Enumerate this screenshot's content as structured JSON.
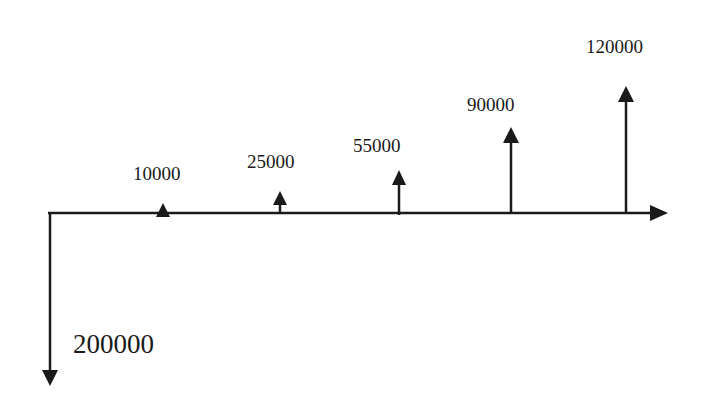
{
  "diagram": {
    "type": "cash-flow-diagram",
    "color": "#1a1a1a",
    "outflow": {
      "period": 0,
      "amount": 200000,
      "label": "200000"
    },
    "inflows": [
      {
        "period": 1,
        "amount": 10000,
        "label": "10000"
      },
      {
        "period": 2,
        "amount": 25000,
        "label": "25000"
      },
      {
        "period": 3,
        "amount": 55000,
        "label": "55000"
      },
      {
        "period": 4,
        "amount": 90000,
        "label": "90000"
      },
      {
        "period": 5,
        "amount": 120000,
        "label": "120000"
      }
    ]
  }
}
